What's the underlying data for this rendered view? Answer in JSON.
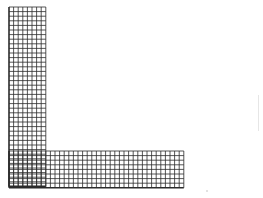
{
  "figure": {
    "shape": "L-shaped grid",
    "width": 263,
    "height": 198,
    "background": "#ffffff",
    "grid_color": "#2b2b2b",
    "cell_size": 4.6,
    "vertical_bar": {
      "x": 9,
      "y": 7,
      "cols": 8,
      "rows": 39
    },
    "horizontal_bar": {
      "x": 9,
      "y": 151,
      "cols": 38,
      "rows": 8
    }
  },
  "artifacts": {
    "faint_line": {
      "x": 258,
      "y": 95,
      "height": 36
    },
    "speck": {
      "x": 206,
      "y": 190
    }
  }
}
